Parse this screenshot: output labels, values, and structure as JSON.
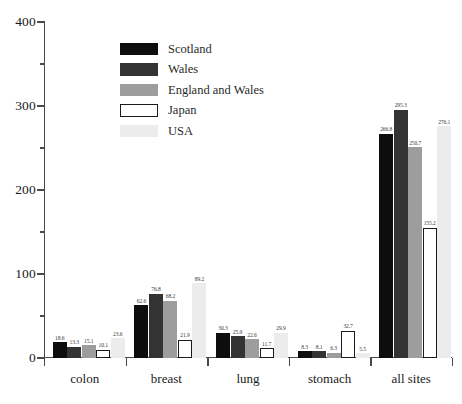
{
  "chart_data": {
    "type": "bar",
    "title": "",
    "subtitle": "",
    "xlabel": "",
    "ylabel": "",
    "ylim": [
      0,
      400
    ],
    "y_major_ticks": [
      0,
      100,
      200,
      300,
      400
    ],
    "y_minor_ticks": [
      50,
      150,
      250,
      350
    ],
    "y_tick_labels": [
      "0",
      "100",
      "200",
      "300",
      "400"
    ],
    "grid": false,
    "legend_position": "top-center-left",
    "categories": [
      "colon",
      "breast",
      "lung",
      "stomach",
      "all sites"
    ],
    "series": [
      {
        "name": "Scotland",
        "color": "#0d0d0d",
        "border": "#0d0d0d",
        "values": [
          18.6,
          62.6,
          30.3,
          8.3,
          266.8
        ],
        "labels": [
          "18.6",
          "62.6",
          "30.3",
          "8.3",
          "266.8"
        ]
      },
      {
        "name": "Wales",
        "color": "#333333",
        "border": "#333333",
        "values": [
          13.3,
          76.8,
          25.9,
          8.1,
          295.3
        ],
        "labels": [
          "13.3",
          "76.8",
          "25.9",
          "8.1",
          "295.3"
        ]
      },
      {
        "name": "England and Wales",
        "color": "#9d9d9d",
        "border": "#9d9d9d",
        "values": [
          15.1,
          68.2,
          22.6,
          6.3,
          250.7
        ],
        "labels": [
          "15.1",
          "68.2",
          "22.6",
          "6.3",
          "250.7"
        ]
      },
      {
        "name": "Japan",
        "color": "#ffffff",
        "border": "#1a1a1a",
        "values": [
          10.1,
          21.9,
          11.7,
          32.7,
          155.2
        ],
        "labels": [
          "10.1",
          "21.9",
          "11.7",
          "32.7",
          "155.2"
        ]
      },
      {
        "name": "USA",
        "color": "#ececec",
        "border": "#ececec",
        "values": [
          23.6,
          89.2,
          29.9,
          5.5,
          276.1
        ],
        "labels": [
          "23.6",
          "89.2",
          "29.9",
          "5.5",
          "276.1"
        ]
      }
    ]
  },
  "legend": {
    "items": [
      {
        "label": "Scotland"
      },
      {
        "label": "Wales"
      },
      {
        "label": "England and Wales"
      },
      {
        "label": "Japan"
      },
      {
        "label": "USA"
      }
    ]
  },
  "axes": {
    "y": {
      "labels": [
        "400",
        "300",
        "200",
        "100",
        "0"
      ]
    },
    "x": {
      "labels": [
        "colon",
        "breast",
        "lung",
        "stomach",
        "all sites"
      ]
    }
  }
}
